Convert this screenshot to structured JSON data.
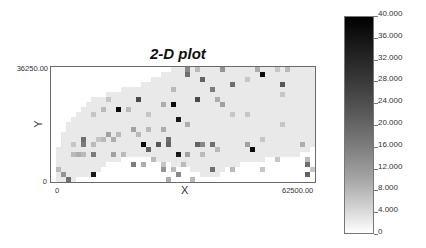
{
  "chart_data": {
    "type": "heatmap",
    "title": "2-D plot",
    "xlabel": "X",
    "ylabel": "Y",
    "xlim": [
      0,
      62500.0
    ],
    "ylim": [
      0,
      36250.0
    ],
    "x_ticks": [
      "0",
      "62500.00"
    ],
    "y_ticks": [
      "0",
      "36250.00"
    ],
    "colorbar": {
      "min": 0,
      "max": 40.0,
      "ticks": [
        "40.000",
        "36.000",
        "32.000",
        "28.000",
        "24.000",
        "20.000",
        "16.000",
        "12.000",
        "8.000",
        "4.000",
        "0"
      ],
      "colormap": "white-to-black grayscale"
    },
    "grid": {
      "cols": 53,
      "rows": 23,
      "cell_px": 5
    },
    "background_cell_value": 3,
    "region_rows": [
      {
        "row": 0,
        "c0": 24,
        "c1": 52
      },
      {
        "row": 1,
        "c0": 22,
        "c1": 52
      },
      {
        "row": 2,
        "c0": 20,
        "c1": 52
      },
      {
        "row": 3,
        "c0": 18,
        "c1": 52
      },
      {
        "row": 4,
        "c0": 14,
        "c1": 52
      },
      {
        "row": 5,
        "c0": 11,
        "c1": 52
      },
      {
        "row": 6,
        "c0": 8,
        "c1": 52
      },
      {
        "row": 7,
        "c0": 7,
        "c1": 52
      },
      {
        "row": 8,
        "c0": 6,
        "c1": 52
      },
      {
        "row": 9,
        "c0": 5,
        "c1": 52
      },
      {
        "row": 10,
        "c0": 4,
        "c1": 52
      },
      {
        "row": 11,
        "c0": 3,
        "c1": 52
      },
      {
        "row": 12,
        "c0": 3,
        "c1": 52
      },
      {
        "row": 13,
        "c0": 2,
        "c1": 52
      },
      {
        "row": 14,
        "c0": 2,
        "c1": 52
      },
      {
        "row": 15,
        "c0": 2,
        "c1": 52
      },
      {
        "row": 16,
        "c0": 1,
        "c1": 51
      },
      {
        "row": 17,
        "c0": 1,
        "c1": 49
      },
      {
        "row": 18,
        "c0": 1,
        "c1": 13,
        "c2": 21,
        "c3": 42
      },
      {
        "row": 19,
        "c0": 1,
        "c1": 10,
        "c2": 24,
        "c3": 37
      },
      {
        "row": 20,
        "c0": 1,
        "c1": 9,
        "c2": 28,
        "c3": 34
      },
      {
        "row": 21,
        "c0": 1,
        "c1": 7,
        "c2": 30,
        "c3": 33
      },
      {
        "row": 22,
        "c0": 1,
        "c1": 4
      }
    ],
    "points": [
      {
        "col": 27,
        "row": 1,
        "v": 22
      },
      {
        "col": 27,
        "row": 0,
        "v": 18
      },
      {
        "col": 29,
        "row": 0,
        "v": 10
      },
      {
        "col": 34,
        "row": 0,
        "v": 16
      },
      {
        "col": 41,
        "row": 0,
        "v": 12
      },
      {
        "col": 42,
        "row": 1,
        "v": 38
      },
      {
        "col": 45,
        "row": 0,
        "v": 8
      },
      {
        "col": 47,
        "row": 0,
        "v": 10
      },
      {
        "col": 30,
        "row": 2,
        "v": 24
      },
      {
        "col": 36,
        "row": 3,
        "v": 22
      },
      {
        "col": 46,
        "row": 3,
        "v": 26
      },
      {
        "col": 24,
        "row": 4,
        "v": 10
      },
      {
        "col": 32,
        "row": 4,
        "v": 20
      },
      {
        "col": 39,
        "row": 2,
        "v": 8
      },
      {
        "col": 33,
        "row": 6,
        "v": 12
      },
      {
        "col": 34,
        "row": 7,
        "v": 14
      },
      {
        "col": 46,
        "row": 5,
        "v": 8
      },
      {
        "col": 29,
        "row": 6,
        "v": 28
      },
      {
        "col": 24,
        "row": 7,
        "v": 38
      },
      {
        "col": 17,
        "row": 6,
        "v": 28
      },
      {
        "col": 22,
        "row": 7,
        "v": 12
      },
      {
        "col": 36,
        "row": 9,
        "v": 8
      },
      {
        "col": 11,
        "row": 6,
        "v": 8
      },
      {
        "col": 25,
        "row": 10,
        "v": 36
      },
      {
        "col": 13,
        "row": 8,
        "v": 38
      },
      {
        "col": 10,
        "row": 8,
        "v": 10
      },
      {
        "col": 8,
        "row": 9,
        "v": 8
      },
      {
        "col": 15,
        "row": 8,
        "v": 10
      },
      {
        "col": 19,
        "row": 9,
        "v": 8
      },
      {
        "col": 27,
        "row": 11,
        "v": 12
      },
      {
        "col": 39,
        "row": 9,
        "v": 8
      },
      {
        "col": 46,
        "row": 11,
        "v": 8
      },
      {
        "col": 22,
        "row": 12,
        "v": 12
      },
      {
        "col": 16,
        "row": 12,
        "v": 14
      },
      {
        "col": 19,
        "row": 12,
        "v": 10
      },
      {
        "col": 23,
        "row": 14,
        "v": 22
      },
      {
        "col": 18,
        "row": 15,
        "v": 38
      },
      {
        "col": 21,
        "row": 15,
        "v": 26
      },
      {
        "col": 23,
        "row": 15,
        "v": 24
      },
      {
        "col": 29,
        "row": 15,
        "v": 24
      },
      {
        "col": 32,
        "row": 15,
        "v": 22
      },
      {
        "col": 30,
        "row": 15,
        "v": 18
      },
      {
        "col": 40,
        "row": 16,
        "v": 38
      },
      {
        "col": 39,
        "row": 15,
        "v": 14
      },
      {
        "col": 42,
        "row": 14,
        "v": 8
      },
      {
        "col": 50,
        "row": 15,
        "v": 12
      },
      {
        "col": 11,
        "row": 13,
        "v": 14
      },
      {
        "col": 13,
        "row": 13,
        "v": 10
      },
      {
        "col": 17,
        "row": 13,
        "v": 10
      },
      {
        "col": 12,
        "row": 14,
        "v": 12
      },
      {
        "col": 10,
        "row": 14,
        "v": 10
      },
      {
        "col": 9,
        "row": 14,
        "v": 8
      },
      {
        "col": 6,
        "row": 14,
        "v": 22
      },
      {
        "col": 6,
        "row": 15,
        "v": 20
      },
      {
        "col": 4,
        "row": 15,
        "v": 8
      },
      {
        "col": 8,
        "row": 15,
        "v": 10
      },
      {
        "col": 25,
        "row": 17,
        "v": 36
      },
      {
        "col": 19,
        "row": 16,
        "v": 24
      },
      {
        "col": 27,
        "row": 17,
        "v": 14
      },
      {
        "col": 33,
        "row": 16,
        "v": 10
      },
      {
        "col": 6,
        "row": 17,
        "v": 10
      },
      {
        "col": 4,
        "row": 17,
        "v": 10
      },
      {
        "col": 5,
        "row": 17,
        "v": 12
      },
      {
        "col": 12,
        "row": 17,
        "v": 14
      },
      {
        "col": 8,
        "row": 17,
        "v": 20
      },
      {
        "col": 14,
        "row": 17,
        "v": 10
      },
      {
        "col": 16,
        "row": 19,
        "v": 20
      },
      {
        "col": 18,
        "row": 19,
        "v": 12
      },
      {
        "col": 20,
        "row": 18,
        "v": 10
      },
      {
        "col": 22,
        "row": 19,
        "v": 8
      },
      {
        "col": 24,
        "row": 20,
        "v": 10
      },
      {
        "col": 30,
        "row": 17,
        "v": 10
      },
      {
        "col": 32,
        "row": 20,
        "v": 22
      },
      {
        "col": 26,
        "row": 19,
        "v": 10
      },
      {
        "col": 36,
        "row": 20,
        "v": 10
      },
      {
        "col": 42,
        "row": 20,
        "v": 8
      },
      {
        "col": 45,
        "row": 18,
        "v": 8
      },
      {
        "col": 51,
        "row": 19,
        "v": 22
      },
      {
        "col": 51,
        "row": 18,
        "v": 10
      },
      {
        "col": 51,
        "row": 21,
        "v": 24
      },
      {
        "col": 52,
        "row": 20,
        "v": 8
      },
      {
        "col": 23,
        "row": 22,
        "v": 12
      },
      {
        "col": 25,
        "row": 21,
        "v": 18
      },
      {
        "col": 28,
        "row": 22,
        "v": 10
      },
      {
        "col": 8,
        "row": 21,
        "v": 36
      },
      {
        "col": 2,
        "row": 21,
        "v": 16
      },
      {
        "col": 3,
        "row": 22,
        "v": 22
      },
      {
        "col": 1,
        "row": 20,
        "v": 10
      },
      {
        "col": 22,
        "row": 20,
        "v": 16
      }
    ]
  }
}
